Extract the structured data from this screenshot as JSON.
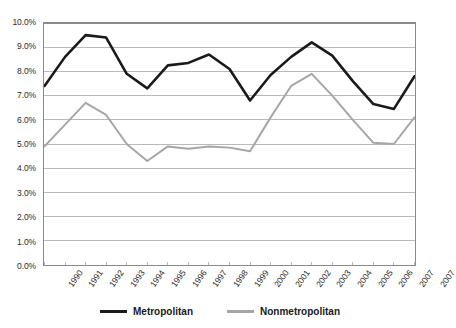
{
  "chart_data": {
    "type": "line",
    "title": "",
    "xlabel": "",
    "ylabel": "",
    "grid": true,
    "legend_position": "bottom",
    "ylim": [
      0,
      10
    ],
    "y_ticks": [
      "0.0%",
      "1.0%",
      "2.0%",
      "3.0%",
      "4.0%",
      "5.0%",
      "6.0%",
      "7.0%",
      "8.0%",
      "9.0%",
      "10.0%"
    ],
    "y_tick_values": [
      0,
      1,
      2,
      3,
      4,
      5,
      6,
      7,
      8,
      9,
      10
    ],
    "categories": [
      "1990",
      "1991",
      "1992",
      "1993",
      "1994",
      "1995",
      "1996",
      "1997",
      "1998",
      "1999",
      "2000",
      "2001",
      "2002",
      "2003",
      "2004",
      "2005",
      "2006",
      "2007",
      "2007"
    ],
    "series": [
      {
        "name": "Metropolitan",
        "color": "#1a1a1a",
        "values": [
          7.4,
          8.6,
          9.5,
          9.4,
          7.9,
          7.3,
          8.25,
          8.35,
          8.7,
          8.1,
          6.8,
          7.85,
          8.6,
          9.2,
          8.65,
          7.6,
          6.65,
          6.45,
          7.8
        ]
      },
      {
        "name": "Nonmetropolitan",
        "color": "#a6a6a6",
        "values": [
          4.9,
          5.8,
          6.7,
          6.2,
          5.0,
          4.3,
          4.9,
          4.8,
          4.9,
          4.85,
          4.7,
          6.1,
          7.4,
          7.9,
          7.0,
          6.0,
          5.05,
          5.0,
          6.1
        ]
      }
    ]
  },
  "legend": {
    "entries": [
      {
        "label": "Metropolitan",
        "color": "#1a1a1a"
      },
      {
        "label": "Nonmetropolitan",
        "color": "#a6a6a6"
      }
    ]
  }
}
